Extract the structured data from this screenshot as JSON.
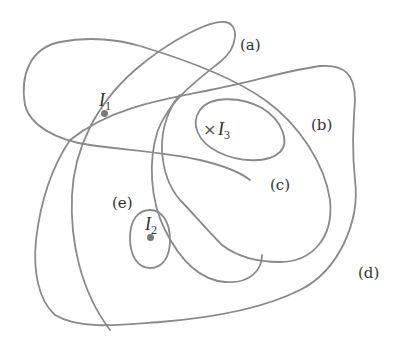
{
  "diagram": {
    "type": "level-curves / closed regions",
    "curves": [
      {
        "id": "a",
        "label": "(a)"
      },
      {
        "id": "b",
        "label": "(b)"
      },
      {
        "id": "c",
        "label": "(c)"
      },
      {
        "id": "d",
        "label": "(d)"
      },
      {
        "id": "e",
        "label": "(e)"
      }
    ],
    "points": [
      {
        "id": "I1",
        "symbol": "I",
        "subscript": "1",
        "marker": "dot"
      },
      {
        "id": "I2",
        "symbol": "I",
        "subscript": "2",
        "marker": "dot"
      },
      {
        "id": "I3",
        "symbol": "I",
        "subscript": "3",
        "marker": "×"
      }
    ],
    "colors": {
      "stroke": "#8a8a8a",
      "text": "#333333",
      "background": "#ffffff"
    }
  }
}
